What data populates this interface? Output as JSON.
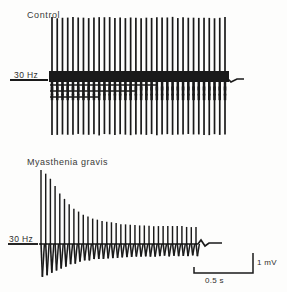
{
  "figure": {
    "type": "emg-repetitive-nerve-stimulation",
    "background_color": "#fdfdfc",
    "trace_color": "#1a1a1a"
  },
  "panels": [
    {
      "id": "control",
      "title": "Control",
      "rate_label": "30 Hz"
    },
    {
      "id": "myasthenia_gravis",
      "title": "Myasthenia gravis",
      "rate_label": "30 Hz"
    }
  ],
  "scale_bars": {
    "vertical_label": "1 mV",
    "horizontal_label": "0.5 s"
  },
  "chart_data": {
    "type": "line",
    "xlabel": "Time",
    "ylabel": "Compound muscle action potential amplitude",
    "stimulation_frequency_hz": 30,
    "x_scale_bar_seconds": 0.5,
    "y_scale_bar_millivolts": 1,
    "series": [
      {
        "name": "Control",
        "n_stimuli": 34,
        "description": "Stable compound muscle action potential amplitude with no decrement across the train",
        "peak_amplitude_mv": 2.8,
        "negative_amplitude_mv": 2.3,
        "values": [
          2.8,
          2.78,
          2.8,
          2.79,
          2.8,
          2.77,
          2.8,
          2.78,
          2.8,
          2.8,
          2.79,
          2.8,
          2.78,
          2.8,
          2.79,
          2.8,
          2.8,
          2.78,
          2.8,
          2.79,
          2.8,
          2.8,
          2.78,
          2.8,
          2.79,
          2.8,
          2.78,
          2.8,
          2.8,
          2.79,
          2.8,
          2.78,
          2.79,
          2.8
        ],
        "negative_values": [
          2.3,
          2.28,
          2.3,
          2.29,
          2.3,
          2.27,
          2.3,
          2.28,
          2.3,
          2.3,
          2.29,
          2.3,
          2.28,
          2.3,
          2.29,
          2.3,
          2.3,
          2.28,
          2.3,
          2.29,
          2.3,
          2.3,
          2.28,
          2.3,
          2.29,
          2.3,
          2.28,
          2.3,
          2.3,
          2.29,
          2.3,
          2.28,
          2.29,
          2.3
        ]
      },
      {
        "name": "Myasthenia gravis",
        "n_stimuli": 34,
        "description": "Marked decremental response: amplitude falls rapidly over the first several stimuli then plateaus at a low level",
        "peak_amplitude_mv": 3.1,
        "plateau_amplitude_mv": 0.72,
        "decrement_percent": 77,
        "values": [
          3.1,
          2.95,
          2.7,
          2.4,
          2.12,
          1.88,
          1.66,
          1.48,
          1.34,
          1.22,
          1.14,
          1.06,
          1.0,
          0.96,
          0.92,
          0.89,
          0.86,
          0.84,
          0.82,
          0.8,
          0.79,
          0.78,
          0.77,
          0.76,
          0.76,
          0.75,
          0.75,
          0.74,
          0.74,
          0.73,
          0.73,
          0.72,
          0.72,
          0.72
        ],
        "negative_values": [
          1.35,
          1.3,
          1.22,
          1.12,
          1.02,
          0.94,
          0.86,
          0.8,
          0.74,
          0.7,
          0.67,
          0.64,
          0.62,
          0.6,
          0.58,
          0.57,
          0.56,
          0.55,
          0.54,
          0.53,
          0.53,
          0.52,
          0.52,
          0.51,
          0.51,
          0.51,
          0.5,
          0.5,
          0.5,
          0.5,
          0.49,
          0.49,
          0.49,
          0.49
        ]
      }
    ]
  }
}
